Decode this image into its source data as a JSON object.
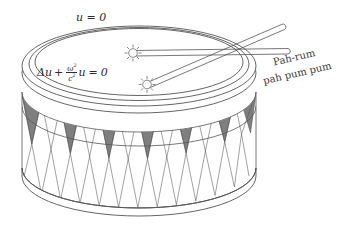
{
  "figure": {
    "background_color": "#ffffff",
    "ink_color": "#2b2b2b",
    "shade_color": "#808080"
  },
  "annotations": {
    "boundary_condition": "u = 0",
    "equation": {
      "lhs_operator": "Δu",
      "plus": "+",
      "fraction_numerator": "ω",
      "fraction_numerator_exponent": "2",
      "fraction_denominator": "c",
      "fraction_denominator_exponent": "2",
      "times_u": "u",
      "equals": "=",
      "rhs": "0",
      "plain": "Δu + ω²/c² u = 0"
    },
    "sound_line_1": "Pah-rum",
    "sound_line_2": "pah pum pum"
  },
  "drum": {
    "top_head_label": "drum-head",
    "rim_label": "drum-rim",
    "shell_label": "drum-shell",
    "pattern": "zigzag-triangles",
    "sticks": [
      {
        "name": "drumstick-upper"
      },
      {
        "name": "drumstick-lower"
      }
    ],
    "strike_points": [
      {
        "name": "strike-burst-upper"
      },
      {
        "name": "strike-burst-lower"
      }
    ]
  }
}
